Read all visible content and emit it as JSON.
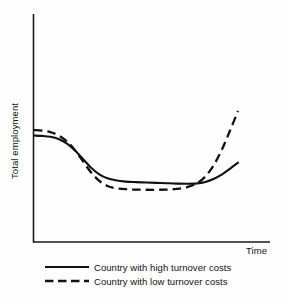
{
  "chart_data": {
    "type": "line",
    "title": "",
    "xlabel": "Time",
    "ylabel": "Total employment",
    "grid": false,
    "axis_ticks": false,
    "xlim": [
      0,
      100
    ],
    "ylim": [
      0,
      100
    ],
    "legend_position": "below-plot-left",
    "line_color": "#111111",
    "axis_color": "#1a1a1a",
    "background_color": "#fefefe",
    "annotations": [
      "Both curves begin at a high employment level at time zero, fall sharply during an adjustment phase, flatten at a trough, then recover at the right edge.",
      "The low-turnover-cost country dips deeper and recovers much faster and higher than the high-turnover-cost country."
    ],
    "series": [
      {
        "name": "Country with high turnover costs",
        "style": "solid",
        "x": [
          0,
          4,
          8,
          12,
          16,
          20,
          24,
          28,
          32,
          36,
          40,
          45,
          50,
          55,
          60,
          65,
          70,
          75,
          80,
          84,
          88,
          92,
          96,
          100
        ],
        "y": [
          58.5,
          58.3,
          57.8,
          56.6,
          54.2,
          50.4,
          45.6,
          40.8,
          37.2,
          35.0,
          33.9,
          33.2,
          32.9,
          32.7,
          32.5,
          32.3,
          32.1,
          32.0,
          32.2,
          33.0,
          34.6,
          37.0,
          40.2,
          43.6
        ]
      },
      {
        "name": "Country with low turnover costs",
        "style": "dashed",
        "x": [
          0,
          4,
          8,
          12,
          16,
          20,
          24,
          28,
          32,
          36,
          40,
          45,
          50,
          55,
          60,
          65,
          70,
          75,
          80,
          84,
          88,
          92,
          96,
          100
        ],
        "y": [
          61.5,
          61.2,
          60.4,
          58.6,
          55.4,
          50.6,
          44.4,
          38.2,
          33.6,
          30.8,
          29.6,
          29.0,
          28.8,
          28.7,
          28.7,
          28.8,
          29.2,
          30.2,
          32.4,
          36.0,
          42.0,
          50.5,
          61.0,
          72.0
        ]
      }
    ]
  },
  "axes": {
    "y_axis_label": "Total employment",
    "x_axis_label": "Time"
  },
  "legend": {
    "items": [
      {
        "label": "Country with high turnover costs",
        "style": "solid"
      },
      {
        "label": "Country with low turnover costs",
        "style": "dashed"
      }
    ]
  }
}
